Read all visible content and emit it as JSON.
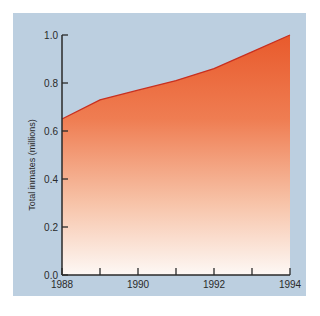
{
  "chart_data": {
    "type": "area",
    "title": "",
    "xlabel": "",
    "ylabel": "Total inmates (millions)",
    "x": [
      1988,
      1989,
      1990,
      1991,
      1992,
      1993,
      1994
    ],
    "series": [
      {
        "name": "Total inmates",
        "values": [
          0.65,
          0.73,
          0.77,
          0.81,
          0.86,
          0.93,
          1.0
        ]
      }
    ],
    "xlim": [
      1988,
      1994
    ],
    "ylim": [
      0.0,
      1.0
    ],
    "x_tick_labels": [
      "1988",
      "1990",
      "1992",
      "1994"
    ],
    "y_tick_labels": [
      "0.0",
      "0.2",
      "0.4",
      "0.6",
      "0.8",
      "1.0"
    ],
    "grid": false,
    "legend": null,
    "colors": {
      "background": "#bccfe0",
      "fill_top": "#e85a2c",
      "fill_bottom": "#fdf6f2",
      "line": "#c83020",
      "axis": "#2a2a2a"
    }
  }
}
